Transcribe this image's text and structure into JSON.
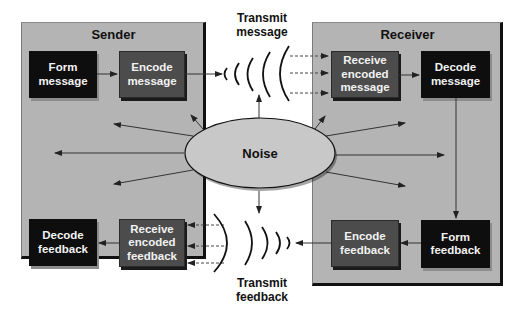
{
  "diagram": {
    "sender": {
      "title": "Sender",
      "boxes": {
        "form_message": "Form\nmessage",
        "encode_message": "Encode\nmessage",
        "decode_feedback": "Decode\nfeedback",
        "receive_encoded_feedback": "Receive\nencoded\nfeedback"
      }
    },
    "receiver": {
      "title": "Receiver",
      "boxes": {
        "receive_encoded_message": "Receive\nencoded\nmessage",
        "decode_message": "Decode\nmessage",
        "encode_feedback": "Encode\nfeedback",
        "form_feedback": "Form\nfeedback"
      }
    },
    "channel": {
      "transmit_message": "Transmit\nmessage",
      "transmit_feedback": "Transmit\nfeedback"
    },
    "noise": {
      "label": "Noise"
    },
    "colors": {
      "panel": "#b4b4b4",
      "dark_box": "#0e0e0e",
      "mid_box": "#4c4c4c",
      "noise_fill": "#c8c8c8",
      "line": "#222222"
    }
  }
}
